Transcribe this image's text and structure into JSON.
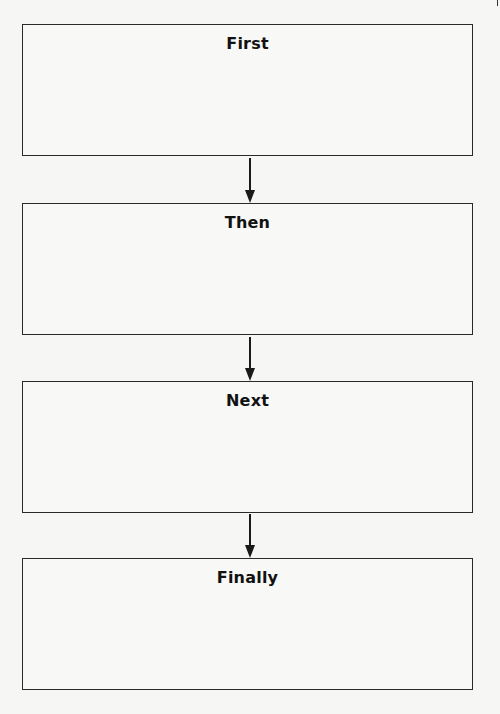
{
  "diagram": {
    "type": "flowchart",
    "direction": "top-to-bottom",
    "steps": [
      {
        "label": "First"
      },
      {
        "label": "Then"
      },
      {
        "label": "Next"
      },
      {
        "label": "Finally"
      }
    ],
    "connectors": [
      {
        "from": "First",
        "to": "Then"
      },
      {
        "from": "Then",
        "to": "Next"
      },
      {
        "from": "Next",
        "to": "Finally"
      }
    ],
    "colors": {
      "stroke": "#2a2a2a",
      "background": "#f6f6f4"
    }
  }
}
